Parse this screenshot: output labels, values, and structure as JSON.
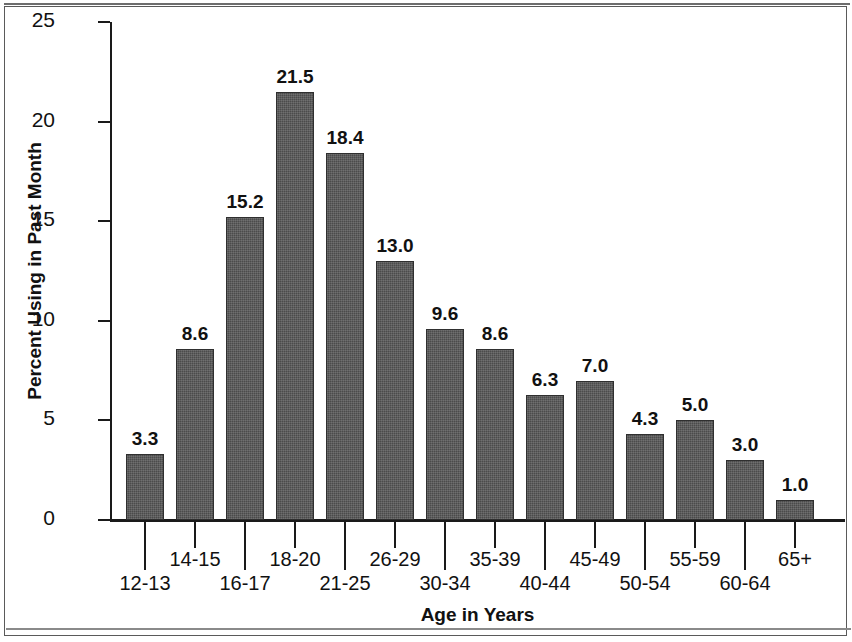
{
  "chart_data": {
    "type": "bar",
    "title": "",
    "subtitle": "",
    "xlabel": "Age in Years",
    "ylabel": "Percent Using in Past Month",
    "ylim": [
      0,
      25
    ],
    "yticks": [
      0,
      5,
      10,
      15,
      20,
      25
    ],
    "ytick_labels": [
      "0",
      "5",
      "10",
      "15",
      "20",
      "25"
    ],
    "grid": false,
    "legend": null,
    "bar_color": "#4b4b4b",
    "categories": [
      "12-13",
      "14-15",
      "16-17",
      "18-20",
      "21-25",
      "26-29",
      "30-34",
      "35-39",
      "40-44",
      "45-49",
      "50-54",
      "55-59",
      "60-64",
      "65+"
    ],
    "series": [
      {
        "name": "Percent Using in Past Month",
        "values": [
          3.3,
          8.6,
          15.2,
          21.5,
          18.4,
          13.0,
          9.6,
          8.6,
          6.3,
          7.0,
          4.3,
          5.0,
          3.0,
          1.0
        ]
      }
    ],
    "data_labels": [
      "3.3",
      "8.6",
      "15.2",
      "21.5",
      "18.4",
      "13.0",
      "9.6",
      "8.6",
      "6.3",
      "7.0",
      "4.3",
      "5.0",
      "3.0",
      "1.0"
    ],
    "tick_label_rows": [
      "bottom",
      "top",
      "bottom",
      "top",
      "bottom",
      "top",
      "bottom",
      "top",
      "bottom",
      "top",
      "bottom",
      "top",
      "bottom",
      "top"
    ]
  }
}
